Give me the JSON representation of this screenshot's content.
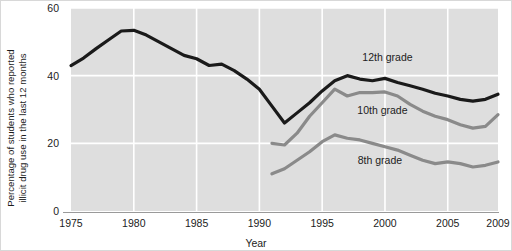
{
  "chart_data": {
    "type": "line",
    "title": "",
    "xlabel": "Year",
    "ylabel": "Percentage of students who reported illicit drug use in the last 12 months",
    "ylabel_line1": "Percentage of students who reported",
    "ylabel_line2": "illicit drug use in the last 12 months",
    "xlim": [
      1975,
      2009
    ],
    "ylim": [
      0,
      60
    ],
    "xticks": [
      1975,
      1980,
      1985,
      1990,
      1995,
      2000,
      2005,
      2009
    ],
    "xtick_labels": [
      "1975",
      "1980",
      "1985",
      "1990",
      "1995",
      "2000",
      "2005",
      "2009"
    ],
    "yticks": [
      0,
      20,
      40,
      60
    ],
    "ytick_labels": [
      "0",
      "20",
      "40",
      "60"
    ],
    "grid": true,
    "grid_color": "#ffffff",
    "plot_background": "#dedede",
    "legend_position": "inline-right",
    "series": [
      {
        "name": "12th grade",
        "label": "12th grade",
        "color": "#1a1a1a",
        "width": 3.2,
        "label_x": 2000.2,
        "label_y": 44.2,
        "x": [
          1975,
          1976,
          1977,
          1978,
          1979,
          1980,
          1981,
          1982,
          1983,
          1984,
          1985,
          1986,
          1987,
          1988,
          1989,
          1990,
          1991,
          1992,
          1993,
          1994,
          1995,
          1996,
          1997,
          1998,
          1999,
          2000,
          2001,
          2002,
          2003,
          2004,
          2005,
          2006,
          2007,
          2008,
          2009
        ],
        "values": [
          43.0,
          45.2,
          48.0,
          50.6,
          53.2,
          53.4,
          52.0,
          50.0,
          48.0,
          46.0,
          45.0,
          43.0,
          43.4,
          41.5,
          39.0,
          36.0,
          31.0,
          26.0,
          29.0,
          32.0,
          35.5,
          38.5,
          40.0,
          39.0,
          38.5,
          39.2,
          38.0,
          37.0,
          36.0,
          34.8,
          34.0,
          33.0,
          32.5,
          33.0,
          34.5
        ]
      },
      {
        "name": "10th grade",
        "label": "10th grade",
        "color": "#8a8a8a",
        "width": 3.2,
        "label_x": 1999.8,
        "label_y": 28.8,
        "x": [
          1991,
          1992,
          1993,
          1994,
          1995,
          1996,
          1997,
          1998,
          1999,
          2000,
          2001,
          2002,
          2003,
          2004,
          2005,
          2006,
          2007,
          2008,
          2009
        ],
        "values": [
          20.0,
          19.5,
          23.0,
          28.0,
          32.0,
          36.0,
          34.0,
          35.0,
          35.0,
          35.2,
          34.0,
          31.5,
          29.5,
          28.0,
          27.0,
          25.5,
          24.5,
          25.0,
          28.5
        ]
      },
      {
        "name": "8th grade",
        "label": "8th grade",
        "color": "#8a8a8a",
        "width": 3.2,
        "label_x": 1999.6,
        "label_y": 14.0,
        "x": [
          1991,
          1992,
          1993,
          1994,
          1995,
          1996,
          1997,
          1998,
          1999,
          2000,
          2001,
          2002,
          2003,
          2004,
          2005,
          2006,
          2007,
          2008,
          2009
        ],
        "values": [
          11.0,
          12.5,
          15.0,
          17.5,
          20.5,
          22.5,
          21.5,
          21.0,
          20.0,
          19.0,
          18.0,
          16.5,
          15.0,
          14.0,
          14.5,
          14.0,
          13.0,
          13.5,
          14.5
        ]
      }
    ]
  }
}
